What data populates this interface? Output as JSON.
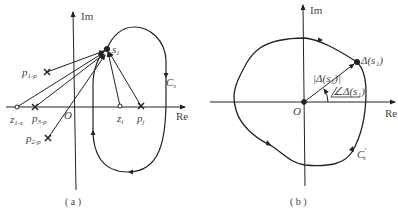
{
  "panel_a": {
    "caption": "( a )",
    "axis_re": "Re",
    "axis_im": "Im",
    "origin": "O",
    "point_s": "s",
    "point_s_sub": "1",
    "contour": "C",
    "contour_sub": "s",
    "zero_z": "z",
    "zero_z_sub": "i",
    "pole_p": "p",
    "pole_p_sub": "j",
    "pole_1": "p",
    "pole_1_sub": "1-p",
    "zero_1": "z",
    "zero_1_sub": "1-z",
    "pole_3": "p",
    "pole_3_sub": "3-p",
    "pole_2": "p",
    "pole_2_sub": "2-p"
  },
  "panel_b": {
    "caption": "( b )",
    "axis_re": "Re",
    "axis_im": "Im",
    "origin": "O",
    "point_label": "Δ(s₁)",
    "magnitude_label": "|Δ(s₁)|",
    "angle_label": "∠Δ(s₁)",
    "contour": "C",
    "contour_sup": "′",
    "contour_sub": "s"
  },
  "colors": {
    "ink": "#222222",
    "text": "#444444",
    "background": "#ffffff"
  }
}
